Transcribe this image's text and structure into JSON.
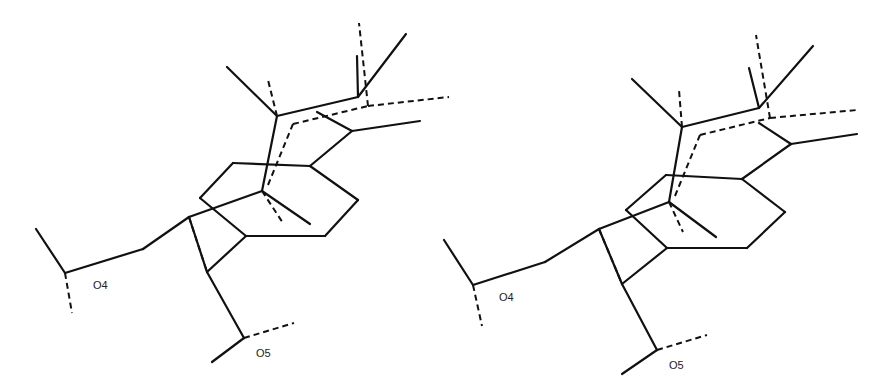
{
  "figure": {
    "type": "stereo-pair molecular structure diagram",
    "colors": {
      "line": "#111111",
      "background": "#ffffff"
    },
    "views": [
      {
        "name": "left-view",
        "labels": [
          {
            "text": "O4",
            "x": 93,
            "y": 279
          },
          {
            "text": "O5",
            "x": 256,
            "y": 347
          }
        ],
        "solid_bonds": [
          [
            233,
            163,
            310,
            166
          ],
          [
            310,
            166,
            358,
            200
          ],
          [
            358,
            200,
            325,
            236
          ],
          [
            325,
            236,
            246,
            236
          ],
          [
            246,
            236,
            200,
            198
          ],
          [
            200,
            198,
            233,
            163
          ],
          [
            246,
            236,
            207,
            272
          ],
          [
            207,
            272,
            189,
            217
          ],
          [
            189,
            217,
            262,
            191
          ],
          [
            262,
            191,
            310,
            224
          ],
          [
            262,
            191,
            277,
            116
          ],
          [
            277,
            116,
            227,
            67
          ],
          [
            277,
            116,
            358,
            97
          ],
          [
            358,
            97,
            406,
            34
          ],
          [
            358,
            97,
            357,
            56
          ],
          [
            310,
            166,
            352,
            131
          ],
          [
            352,
            131,
            420,
            121
          ],
          [
            352,
            131,
            317,
            112
          ],
          [
            189,
            217,
            143,
            249
          ],
          [
            143,
            249,
            65,
            273
          ],
          [
            65,
            273,
            36,
            229
          ],
          [
            207,
            272,
            244,
            338
          ],
          [
            244,
            338,
            212,
            362
          ]
        ],
        "dashed_bonds": [
          [
            262,
            191,
            283,
            223
          ],
          [
            277,
            116,
            268,
            80
          ],
          [
            268,
            185,
            293,
            124
          ],
          [
            293,
            124,
            368,
            106
          ],
          [
            368,
            106,
            449,
            97
          ],
          [
            368,
            106,
            359,
            23
          ],
          [
            65,
            273,
            72,
            313
          ],
          [
            244,
            338,
            294,
            323
          ],
          [
            189,
            217,
            207,
            272
          ]
        ]
      },
      {
        "name": "right-view",
        "labels": [
          {
            "text": "O4",
            "x": 499,
            "y": 291
          },
          {
            "text": "O5",
            "x": 669,
            "y": 359
          }
        ],
        "solid_bonds": [
          [
            666,
            175,
            742,
            179
          ],
          [
            742,
            179,
            785,
            212
          ],
          [
            785,
            212,
            747,
            248
          ],
          [
            747,
            248,
            667,
            248
          ],
          [
            667,
            248,
            626,
            210
          ],
          [
            626,
            210,
            666,
            175
          ],
          [
            667,
            248,
            622,
            284
          ],
          [
            622,
            284,
            599,
            229
          ],
          [
            599,
            229,
            669,
            202
          ],
          [
            669,
            202,
            716,
            237
          ],
          [
            669,
            202,
            682,
            127
          ],
          [
            682,
            127,
            632,
            79
          ],
          [
            682,
            127,
            759,
            108
          ],
          [
            759,
            108,
            813,
            46
          ],
          [
            759,
            108,
            749,
            68
          ],
          [
            742,
            179,
            791,
            144
          ],
          [
            791,
            144,
            857,
            134
          ],
          [
            791,
            144,
            759,
            123
          ],
          [
            599,
            229,
            545,
            262
          ],
          [
            545,
            262,
            473,
            285
          ],
          [
            473,
            285,
            444,
            240
          ],
          [
            622,
            284,
            657,
            350
          ],
          [
            657,
            350,
            622,
            374
          ]
        ],
        "dashed_bonds": [
          [
            669,
            202,
            683,
            232
          ],
          [
            682,
            127,
            679,
            90
          ],
          [
            675,
            196,
            700,
            135
          ],
          [
            700,
            135,
            770,
            118
          ],
          [
            770,
            118,
            857,
            110
          ],
          [
            770,
            118,
            756,
            35
          ],
          [
            473,
            285,
            482,
            326
          ],
          [
            657,
            350,
            707,
            335
          ],
          [
            599,
            229,
            622,
            284
          ]
        ]
      }
    ]
  }
}
